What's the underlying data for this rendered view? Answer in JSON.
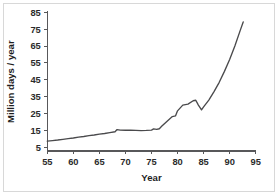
{
  "figure": {
    "background_color": "#ffffff",
    "border_color": "#d8d8d8",
    "line_color": "#4a4a4c",
    "axis_color": "#58585a",
    "text_color": "#2b2b2b"
  },
  "chart_data": {
    "type": "line",
    "title": "",
    "subtitle": "",
    "xlabel": "Year",
    "ylabel": "Million days / year",
    "xlim": [
      55,
      95
    ],
    "ylim": [
      0,
      88
    ],
    "grid": false,
    "legend": null,
    "legend_position": "none",
    "x_ticks": [
      55,
      60,
      65,
      70,
      75,
      80,
      85,
      90,
      95
    ],
    "x_tick_labels": [
      "55",
      "60",
      "65",
      "70",
      "75",
      "80",
      "85",
      "90",
      "95"
    ],
    "y_ticks": [
      5,
      15,
      25,
      35,
      45,
      55,
      65,
      75,
      85
    ],
    "y_tick_labels": [
      "5",
      "15",
      "25",
      "35",
      "45",
      "55",
      "65",
      "75",
      "85"
    ],
    "series": [
      {
        "name": "Million days / year",
        "color": "#4a4a4c",
        "x": [
          55,
          56,
          57,
          58,
          59,
          60,
          61,
          62,
          63,
          64,
          65,
          66,
          67,
          68,
          68.4,
          69,
          70,
          71,
          72,
          73,
          74,
          75,
          75.4,
          76,
          76.5,
          77,
          78,
          79,
          79.6,
          80,
          81,
          82,
          83,
          83.5,
          84,
          84.6,
          85,
          86,
          87,
          88,
          89,
          90,
          91,
          92,
          92.6
        ],
        "y": [
          8.7,
          9.0,
          9.3,
          9.7,
          10.1,
          10.5,
          11.0,
          11.4,
          11.9,
          12.3,
          12.8,
          13.2,
          13.7,
          14.2,
          15.5,
          15.2,
          15.1,
          15.1,
          15.0,
          14.9,
          15.0,
          15.2,
          15.9,
          15.6,
          16.0,
          17.6,
          20.5,
          23.2,
          23.6,
          26.6,
          30.0,
          30.6,
          32.6,
          32.9,
          30.0,
          27.2,
          29.0,
          33.0,
          38.0,
          43.5,
          50.0,
          57.0,
          65.0,
          74.0,
          79.3
        ]
      }
    ]
  }
}
